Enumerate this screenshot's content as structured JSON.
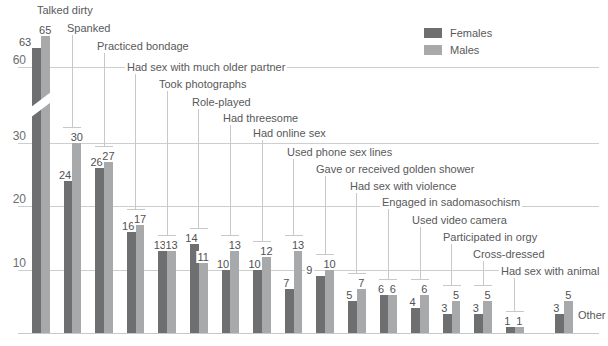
{
  "chart_data": {
    "type": "bar",
    "title": "",
    "legend": {
      "position": "top-right",
      "entries": [
        {
          "label": "Females",
          "color": "#6d6f71"
        },
        {
          "label": "Males",
          "color": "#a7a9ab"
        }
      ]
    },
    "categories": [
      "Talked dirty",
      "Spanked",
      "Practiced bondage",
      "Had sex with much older partner",
      "Took photographs",
      "Role-played",
      "Had threesome",
      "Had online sex",
      "Used phone sex lines",
      "Gave or received golden shower",
      "Had sex with violence",
      "Engaged in sadomasochism",
      "Used video camera",
      "Participated in orgy",
      "Cross-dressed",
      "Had sex with animal",
      "Other"
    ],
    "series": [
      {
        "name": "Females",
        "values": [
          63,
          24,
          26,
          16,
          13,
          14,
          10,
          10,
          7,
          9,
          5,
          6,
          4,
          3,
          3,
          1,
          3
        ]
      },
      {
        "name": "Males",
        "values": [
          65,
          30,
          27,
          17,
          13,
          11,
          13,
          12,
          13,
          10,
          7,
          6,
          6,
          5,
          5,
          1,
          5
        ]
      }
    ],
    "y_axis": {
      "ticks": [
        10,
        20,
        30,
        60
      ],
      "broken": true,
      "break_between": [
        30,
        60
      ]
    },
    "axis_break_on_first_pair": true,
    "colors": {
      "females": "#6d6f71",
      "males": "#a7a9ab",
      "grid": "#cccecf",
      "leader": "#c6c8ca",
      "text": "#58595b"
    }
  }
}
